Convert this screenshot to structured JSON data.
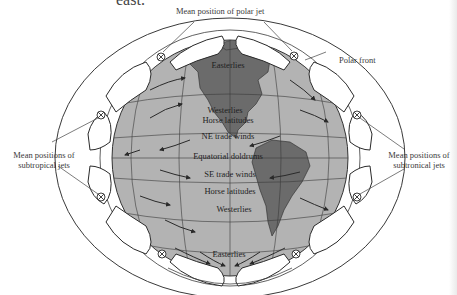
{
  "fragment_text": "east.",
  "callouts": {
    "polar_jet": "Mean position of polar jet",
    "polar_front": "Polar front",
    "subtropical_left": [
      "Mean positions of",
      "subtropical jets"
    ],
    "subtropical_right": [
      "Mean positions of",
      "subtronical jets"
    ]
  },
  "globe_labels": [
    {
      "id": "easterlies-north",
      "text": "Easterlies"
    },
    {
      "id": "westerlies-north",
      "text": "Westerlies"
    },
    {
      "id": "horse-latitudes-north",
      "text": "Horse latitudes"
    },
    {
      "id": "ne-trade-winds",
      "text": "NE trade winds"
    },
    {
      "id": "equatorial-doldrums",
      "text": "Equatorial doldrums"
    },
    {
      "id": "se-trade-winds",
      "text": "SE trade winds"
    },
    {
      "id": "horse-latitudes-south",
      "text": "Horse latitudes"
    },
    {
      "id": "westerlies-south",
      "text": "Westerlies"
    },
    {
      "id": "easterlies-south",
      "text": "Easterlies"
    }
  ],
  "colors": {
    "globe": "#b3b3b3",
    "land": "#6b6b6b",
    "lines": "#3a3a3a",
    "cells": "#ffffff"
  }
}
